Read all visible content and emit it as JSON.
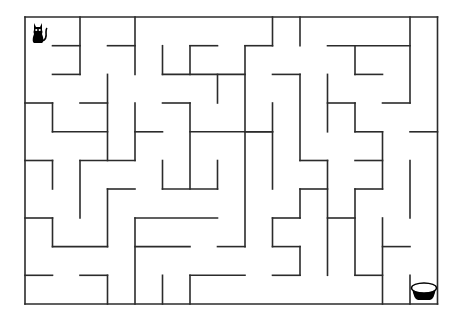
{
  "game": {
    "type": "maze",
    "start_icon": "cat-icon",
    "goal_icon": "bowl-icon",
    "wall_color": "#2b2b2b",
    "background_color": "#ffffff",
    "grid": {
      "cols": 15,
      "rows": 10
    },
    "xs": [
      25,
      52.5,
      80,
      107.5,
      135,
      162.5,
      190,
      217.5,
      245,
      272.5,
      300,
      327.5,
      355,
      382.5,
      410,
      437.5
    ],
    "ys": [
      17,
      45.7,
      74.4,
      103,
      131.8,
      160.5,
      189,
      218,
      246.6,
      275.3,
      304
    ],
    "walls": [
      [
        0,
        0,
        15,
        0
      ],
      [
        0,
        0,
        0,
        10
      ],
      [
        0,
        10,
        15,
        10
      ],
      [
        15,
        0,
        15,
        10
      ],
      [
        2,
        0,
        2,
        2
      ],
      [
        1,
        1,
        2,
        1
      ],
      [
        1,
        2,
        2,
        2
      ],
      [
        4,
        0,
        4,
        2
      ],
      [
        3,
        1,
        4,
        1
      ],
      [
        3,
        2,
        3,
        5
      ],
      [
        0,
        3,
        1,
        3
      ],
      [
        1,
        3,
        1,
        4
      ],
      [
        1,
        4,
        3,
        4
      ],
      [
        2,
        3,
        3,
        3
      ],
      [
        4,
        3,
        4,
        5
      ],
      [
        4,
        4,
        5,
        4
      ],
      [
        2,
        5,
        4,
        5
      ],
      [
        0,
        5,
        1,
        5
      ],
      [
        1,
        5,
        1,
        6
      ],
      [
        2,
        5,
        2,
        7
      ],
      [
        3,
        6,
        4,
        6
      ],
      [
        3,
        6,
        3,
        8
      ],
      [
        1,
        8,
        3,
        8
      ],
      [
        0,
        7,
        1,
        7
      ],
      [
        1,
        7,
        1,
        8
      ],
      [
        0,
        9,
        1,
        9
      ],
      [
        2,
        9,
        3,
        9
      ],
      [
        3,
        9,
        3,
        10
      ],
      [
        5,
        1,
        5,
        2
      ],
      [
        5,
        2,
        8,
        2
      ],
      [
        6,
        1,
        6,
        2
      ],
      [
        6,
        1,
        7,
        1
      ],
      [
        7,
        2,
        7,
        3
      ],
      [
        8,
        1,
        8,
        8
      ],
      [
        8,
        1,
        9,
        1
      ],
      [
        9,
        0,
        9,
        1
      ],
      [
        5,
        3,
        6,
        3
      ],
      [
        6,
        3,
        6,
        6
      ],
      [
        6,
        4,
        9,
        4
      ],
      [
        5,
        5,
        5,
        6
      ],
      [
        5,
        6,
        7,
        6
      ],
      [
        7,
        5,
        7,
        6
      ],
      [
        4,
        7,
        7,
        7
      ],
      [
        4,
        7,
        4,
        10
      ],
      [
        4,
        8,
        6,
        8
      ],
      [
        7,
        8,
        8,
        8
      ],
      [
        5,
        9,
        5,
        10
      ],
      [
        6,
        9,
        6,
        10
      ],
      [
        6,
        9,
        8,
        9
      ],
      [
        10,
        0,
        10,
        1
      ],
      [
        9,
        2,
        10,
        2
      ],
      [
        10,
        2,
        10,
        5
      ],
      [
        9,
        3,
        9,
        6
      ],
      [
        8,
        4,
        9,
        4
      ],
      [
        10,
        5,
        11,
        5
      ],
      [
        11,
        1,
        14,
        1
      ],
      [
        14,
        0,
        14,
        3
      ],
      [
        12,
        1,
        12,
        2
      ],
      [
        12,
        2,
        13,
        2
      ],
      [
        11,
        2,
        11,
        4
      ],
      [
        11,
        3,
        12,
        3
      ],
      [
        12,
        3,
        12,
        4
      ],
      [
        12,
        4,
        13,
        4
      ],
      [
        13,
        4,
        13,
        6
      ],
      [
        13,
        3,
        14,
        3
      ],
      [
        14,
        4,
        15,
        4
      ],
      [
        12,
        5,
        13,
        5
      ],
      [
        12,
        6,
        13,
        6
      ],
      [
        10,
        6,
        11,
        6
      ],
      [
        10,
        6,
        10,
        7
      ],
      [
        9,
        7,
        10,
        7
      ],
      [
        9,
        7,
        9,
        8
      ],
      [
        9,
        8,
        10,
        8
      ],
      [
        10,
        8,
        10,
        9
      ],
      [
        9,
        9,
        10,
        9
      ],
      [
        11,
        5,
        11,
        9
      ],
      [
        11,
        7,
        12,
        7
      ],
      [
        12,
        6,
        12,
        9
      ],
      [
        12,
        9,
        13,
        9
      ],
      [
        13,
        7,
        13,
        10
      ],
      [
        13,
        8,
        14,
        8
      ],
      [
        14,
        5,
        14,
        7
      ],
      [
        14,
        9,
        14,
        10
      ]
    ]
  }
}
